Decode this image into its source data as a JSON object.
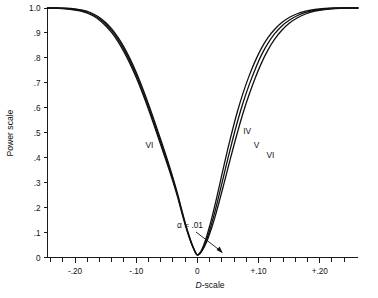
{
  "chart_data": {
    "type": "line",
    "title": "",
    "xlabel": "D-scale",
    "ylabel": "Power scale",
    "xlim": [
      -0.245,
      0.2625
    ],
    "ylim": [
      0,
      1.0
    ],
    "grid": false,
    "legend_position": "inline-curve-labels",
    "x_ticks_major": [
      -0.2,
      -0.1,
      0,
      0.1,
      0.2
    ],
    "x_tick_labels": [
      "-.20",
      "-.10",
      "0",
      "+.10",
      "+.20"
    ],
    "x_minor_tick_step": 0.02,
    "y_ticks": [
      0,
      0.1,
      0.2,
      0.3,
      0.4,
      0.5,
      0.6,
      0.7,
      0.8,
      0.9,
      1.0
    ],
    "y_tick_labels": [
      "0",
      ".1",
      ".2",
      ".3",
      ".4",
      ".5",
      ".6",
      ".7",
      ".8",
      ".9",
      "1.0"
    ],
    "annotations": [
      {
        "name": "alpha-annotation",
        "text": "α = .01",
        "points_to_x": 0,
        "points_to_y": 0.01
      }
    ],
    "curve_labels": [
      {
        "name": "left-branch-label",
        "text": "VI",
        "at_x": -0.085,
        "at_y": 0.44
      },
      {
        "name": "right-curve-label-iv",
        "text": "IV",
        "at_x": 0.075,
        "at_y": 0.495
      },
      {
        "name": "right-curve-label-v",
        "text": "V",
        "at_x": 0.092,
        "at_y": 0.44
      },
      {
        "name": "right-curve-label-vi",
        "text": "VI",
        "at_x": 0.113,
        "at_y": 0.4
      }
    ],
    "series": [
      {
        "name": "IV",
        "color": "#111111",
        "points": [
          [
            -0.245,
            1.0
          ],
          [
            -0.23,
            1.0
          ],
          [
            -0.215,
            0.999
          ],
          [
            -0.2,
            0.996
          ],
          [
            -0.19,
            0.992
          ],
          [
            -0.18,
            0.986
          ],
          [
            -0.17,
            0.976
          ],
          [
            -0.16,
            0.962
          ],
          [
            -0.15,
            0.942
          ],
          [
            -0.14,
            0.916
          ],
          [
            -0.13,
            0.883
          ],
          [
            -0.12,
            0.843
          ],
          [
            -0.11,
            0.796
          ],
          [
            -0.1,
            0.742
          ],
          [
            -0.09,
            0.681
          ],
          [
            -0.08,
            0.615
          ],
          [
            -0.07,
            0.545
          ],
          [
            -0.06,
            0.473
          ],
          [
            -0.05,
            0.399
          ],
          [
            -0.04,
            0.32
          ],
          [
            -0.032,
            0.252
          ],
          [
            -0.026,
            0.195
          ],
          [
            -0.02,
            0.14
          ],
          [
            -0.015,
            0.098
          ],
          [
            -0.01,
            0.061
          ],
          [
            -0.006,
            0.036
          ],
          [
            -0.003,
            0.02
          ],
          [
            0.0,
            0.01
          ],
          [
            0.004,
            0.018
          ],
          [
            0.008,
            0.036
          ],
          [
            0.013,
            0.068
          ],
          [
            0.018,
            0.108
          ],
          [
            0.024,
            0.163
          ],
          [
            0.03,
            0.224
          ],
          [
            0.036,
            0.288
          ],
          [
            0.043,
            0.364
          ],
          [
            0.05,
            0.438
          ],
          [
            0.058,
            0.517
          ],
          [
            0.066,
            0.59
          ],
          [
            0.075,
            0.662
          ],
          [
            0.085,
            0.731
          ],
          [
            0.095,
            0.79
          ],
          [
            0.105,
            0.84
          ],
          [
            0.115,
            0.88
          ],
          [
            0.126,
            0.914
          ],
          [
            0.138,
            0.942
          ],
          [
            0.15,
            0.962
          ],
          [
            0.163,
            0.977
          ],
          [
            0.177,
            0.987
          ],
          [
            0.192,
            0.994
          ],
          [
            0.208,
            0.998
          ],
          [
            0.225,
            1.0
          ],
          [
            0.245,
            1.0
          ],
          [
            0.2625,
            1.0
          ]
        ]
      },
      {
        "name": "V",
        "color": "#111111",
        "points": [
          [
            -0.245,
            1.0
          ],
          [
            -0.23,
            1.0
          ],
          [
            -0.215,
            0.998
          ],
          [
            -0.2,
            0.994
          ],
          [
            -0.19,
            0.99
          ],
          [
            -0.18,
            0.983
          ],
          [
            -0.17,
            0.972
          ],
          [
            -0.16,
            0.957
          ],
          [
            -0.15,
            0.936
          ],
          [
            -0.14,
            0.909
          ],
          [
            -0.13,
            0.875
          ],
          [
            -0.12,
            0.834
          ],
          [
            -0.11,
            0.786
          ],
          [
            -0.1,
            0.731
          ],
          [
            -0.09,
            0.67
          ],
          [
            -0.08,
            0.604
          ],
          [
            -0.07,
            0.534
          ],
          [
            -0.06,
            0.462
          ],
          [
            -0.05,
            0.389
          ],
          [
            -0.04,
            0.312
          ],
          [
            -0.032,
            0.245
          ],
          [
            -0.026,
            0.189
          ],
          [
            -0.02,
            0.136
          ],
          [
            -0.015,
            0.095
          ],
          [
            -0.01,
            0.059
          ],
          [
            -0.006,
            0.035
          ],
          [
            -0.003,
            0.019
          ],
          [
            0.0,
            0.01
          ],
          [
            0.004,
            0.016
          ],
          [
            0.008,
            0.031
          ],
          [
            0.013,
            0.058
          ],
          [
            0.018,
            0.093
          ],
          [
            0.024,
            0.142
          ],
          [
            0.03,
            0.197
          ],
          [
            0.036,
            0.256
          ],
          [
            0.043,
            0.327
          ],
          [
            0.05,
            0.398
          ],
          [
            0.058,
            0.476
          ],
          [
            0.066,
            0.549
          ],
          [
            0.075,
            0.623
          ],
          [
            0.085,
            0.695
          ],
          [
            0.095,
            0.758
          ],
          [
            0.105,
            0.813
          ],
          [
            0.115,
            0.857
          ],
          [
            0.126,
            0.896
          ],
          [
            0.138,
            0.928
          ],
          [
            0.15,
            0.951
          ],
          [
            0.163,
            0.969
          ],
          [
            0.177,
            0.982
          ],
          [
            0.192,
            0.991
          ],
          [
            0.208,
            0.996
          ],
          [
            0.225,
            0.999
          ],
          [
            0.245,
            1.0
          ],
          [
            0.2625,
            1.0
          ]
        ]
      },
      {
        "name": "VI",
        "color": "#111111",
        "points": [
          [
            -0.245,
            1.0
          ],
          [
            -0.23,
            0.999
          ],
          [
            -0.215,
            0.997
          ],
          [
            -0.2,
            0.992
          ],
          [
            -0.19,
            0.987
          ],
          [
            -0.18,
            0.979
          ],
          [
            -0.17,
            0.968
          ],
          [
            -0.16,
            0.951
          ],
          [
            -0.15,
            0.929
          ],
          [
            -0.14,
            0.901
          ],
          [
            -0.13,
            0.866
          ],
          [
            -0.12,
            0.824
          ],
          [
            -0.11,
            0.776
          ],
          [
            -0.1,
            0.721
          ],
          [
            -0.09,
            0.66
          ],
          [
            -0.08,
            0.594
          ],
          [
            -0.07,
            0.524
          ],
          [
            -0.06,
            0.452
          ],
          [
            -0.05,
            0.38
          ],
          [
            -0.04,
            0.304
          ],
          [
            -0.032,
            0.239
          ],
          [
            -0.026,
            0.184
          ],
          [
            -0.02,
            0.132
          ],
          [
            -0.015,
            0.092
          ],
          [
            -0.01,
            0.057
          ],
          [
            -0.006,
            0.034
          ],
          [
            -0.003,
            0.018
          ],
          [
            0.0,
            0.01
          ],
          [
            0.004,
            0.015
          ],
          [
            0.008,
            0.028
          ],
          [
            0.013,
            0.051
          ],
          [
            0.018,
            0.081
          ],
          [
            0.024,
            0.124
          ],
          [
            0.03,
            0.173
          ],
          [
            0.036,
            0.227
          ],
          [
            0.043,
            0.292
          ],
          [
            0.05,
            0.359
          ],
          [
            0.058,
            0.434
          ],
          [
            0.066,
            0.506
          ],
          [
            0.075,
            0.582
          ],
          [
            0.085,
            0.656
          ],
          [
            0.095,
            0.722
          ],
          [
            0.105,
            0.781
          ],
          [
            0.115,
            0.83
          ],
          [
            0.126,
            0.874
          ],
          [
            0.138,
            0.911
          ],
          [
            0.15,
            0.939
          ],
          [
            0.163,
            0.96
          ],
          [
            0.177,
            0.976
          ],
          [
            0.192,
            0.987
          ],
          [
            0.208,
            0.994
          ],
          [
            0.225,
            0.998
          ],
          [
            0.245,
            1.0
          ],
          [
            0.2625,
            1.0
          ]
        ]
      }
    ]
  }
}
